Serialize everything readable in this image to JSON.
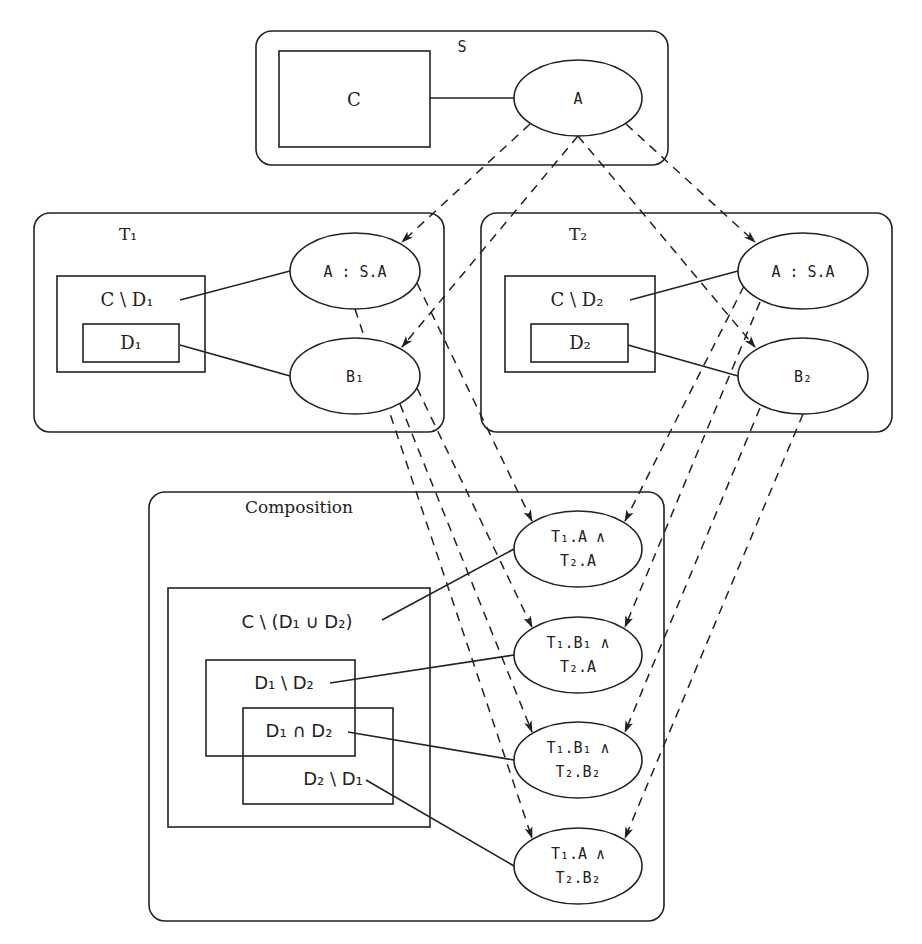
{
  "diagram": {
    "schema_s": {
      "title": "S",
      "set_box": "C",
      "node": "A"
    },
    "theory_t1": {
      "title": "T₁",
      "outer_set": "C \\ D₁",
      "inner_set": "D₁",
      "node_a": "A : S.A",
      "node_b": "B₁"
    },
    "theory_t2": {
      "title": "T₂",
      "outer_set": "C \\ D₂",
      "inner_set": "D₂",
      "node_a": "A : S.A",
      "node_b": "B₂"
    },
    "composition": {
      "title": "Composition",
      "outer_set": "C \\ (D₁ ∪ D₂)",
      "set_d1_minus_d2": "D₁ \\ D₂",
      "set_d1_cap_d2": "D₁ ∩ D₂",
      "set_d2_minus_d1": "D₂ \\ D₁",
      "nodes": [
        {
          "line1": "T₁.A ∧",
          "line2": "T₂.A"
        },
        {
          "line1": "T₁.B₁ ∧",
          "line2": "T₂.A"
        },
        {
          "line1": "T₁.B₁ ∧",
          "line2": "T₂.B₂"
        },
        {
          "line1": "T₁.A ∧",
          "line2": "T₂.B₂"
        }
      ]
    },
    "edges": {
      "solid": [
        [
          "C",
          "S.A"
        ],
        [
          "C \\ D₁",
          "T₁.A"
        ],
        [
          "D₁",
          "T₁.B₁"
        ],
        [
          "C \\ D₂",
          "T₂.A"
        ],
        [
          "D₂",
          "T₂.B₂"
        ],
        [
          "C \\ (D₁ ∪ D₂)",
          "T₁.A ∧ T₂.A"
        ],
        [
          "D₁ \\ D₂",
          "T₁.B₁ ∧ T₂.A"
        ],
        [
          "D₁ ∩ D₂",
          "T₁.B₁ ∧ T₂.B₂"
        ],
        [
          "D₂ \\ D₁",
          "T₁.A ∧ T₂.B₂"
        ]
      ],
      "dashed_arrows": [
        [
          "S.A",
          "T₁.A"
        ],
        [
          "S.A",
          "T₁.B₁"
        ],
        [
          "S.A",
          "T₂.A"
        ],
        [
          "S.A",
          "T₂.B₂"
        ],
        [
          "T₁.A",
          "T₁.A ∧ T₂.A"
        ],
        [
          "T₁.A",
          "T₁.A ∧ T₂.B₂"
        ],
        [
          "T₁.B₁",
          "T₁.B₁ ∧ T₂.A"
        ],
        [
          "T₁.B₁",
          "T₁.B₁ ∧ T₂.B₂"
        ],
        [
          "T₂.A",
          "T₁.A ∧ T₂.A"
        ],
        [
          "T₂.A",
          "T₁.B₁ ∧ T₂.A"
        ],
        [
          "T₂.B₂",
          "T₁.B₁ ∧ T₂.B₂"
        ],
        [
          "T₂.B₂",
          "T₁.A ∧ T₂.B₂"
        ]
      ]
    }
  }
}
